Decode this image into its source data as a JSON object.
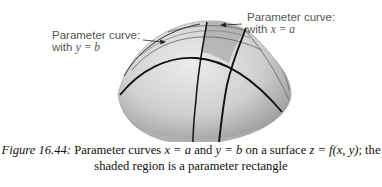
{
  "figure": {
    "labels": {
      "y_eq_b": {
        "line1": "Parameter curve:",
        "line2_prefix": "with ",
        "line2_math": "y = b"
      },
      "x_eq_a": {
        "line1": "Parameter curve:",
        "line2_prefix": "with ",
        "line2_math": "x = a"
      }
    },
    "colors": {
      "surface_light": "#e4e4e4",
      "surface_dark": "#9a9a9a",
      "shaded_region": "#b4b4b4",
      "curve": "#111111",
      "label_text": "#555555"
    }
  },
  "caption": {
    "figure_number": "Figure 16.44:",
    "line1_parts": [
      " Parameter curves ",
      "x = a",
      " and ",
      "y = b",
      " on a surface ",
      "z = f(x, y)",
      "; the"
    ],
    "line2": "shaded region is a parameter rectangle"
  }
}
